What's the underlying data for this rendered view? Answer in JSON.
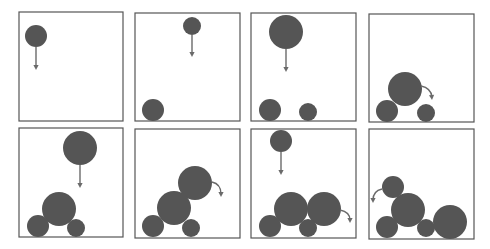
{
  "figure": {
    "colors": {
      "ball": "#555555",
      "frame": "#555555",
      "arrow": "#6a6a6a",
      "background": "#ffffff"
    },
    "panels": [
      {
        "id": 1,
        "frame": [
          19,
          12,
          104,
          109
        ],
        "balls": [
          {
            "cx": 36,
            "cy": 36,
            "r": 11
          }
        ],
        "arrows": [
          {
            "type": "straight",
            "from": [
              36,
              47
            ],
            "to": [
              36,
              70
            ]
          }
        ]
      },
      {
        "id": 2,
        "frame": [
          135,
          13,
          105,
          108
        ],
        "balls": [
          {
            "cx": 192,
            "cy": 26,
            "r": 9
          },
          {
            "cx": 153,
            "cy": 110,
            "r": 11
          }
        ],
        "arrows": [
          {
            "type": "straight",
            "from": [
              192,
              35
            ],
            "to": [
              192,
              57
            ]
          }
        ]
      },
      {
        "id": 3,
        "frame": [
          251,
          13,
          105,
          108
        ],
        "balls": [
          {
            "cx": 286,
            "cy": 32,
            "r": 17
          },
          {
            "cx": 270,
            "cy": 110,
            "r": 11
          },
          {
            "cx": 308,
            "cy": 112,
            "r": 9
          }
        ],
        "arrows": [
          {
            "type": "straight",
            "from": [
              286,
              49
            ],
            "to": [
              286,
              72
            ]
          }
        ]
      },
      {
        "id": 4,
        "frame": [
          369,
          14,
          105,
          108
        ],
        "balls": [
          {
            "cx": 405,
            "cy": 89,
            "r": 17
          },
          {
            "cx": 387,
            "cy": 111,
            "r": 11
          },
          {
            "cx": 426,
            "cy": 113,
            "r": 9
          }
        ],
        "arrows": [
          {
            "type": "curved",
            "from": [
              421,
              86
            ],
            "ctrl": [
              431,
              88
            ],
            "to": [
              432,
              100
            ]
          }
        ]
      },
      {
        "id": 5,
        "frame": [
          19,
          128,
          104,
          109
        ],
        "balls": [
          {
            "cx": 80,
            "cy": 148,
            "r": 17
          },
          {
            "cx": 59,
            "cy": 209,
            "r": 17
          },
          {
            "cx": 38,
            "cy": 226,
            "r": 11
          },
          {
            "cx": 76,
            "cy": 228,
            "r": 9
          }
        ],
        "arrows": [
          {
            "type": "straight",
            "from": [
              80,
              165
            ],
            "to": [
              80,
              188
            ]
          }
        ]
      },
      {
        "id": 6,
        "frame": [
          135,
          129,
          105,
          109
        ],
        "balls": [
          {
            "cx": 195,
            "cy": 183,
            "r": 17
          },
          {
            "cx": 174,
            "cy": 208,
            "r": 17
          },
          {
            "cx": 153,
            "cy": 226,
            "r": 11
          },
          {
            "cx": 191,
            "cy": 228,
            "r": 9
          }
        ],
        "arrows": [
          {
            "type": "curved",
            "from": [
              212,
              182
            ],
            "ctrl": [
              221,
              184
            ],
            "to": [
              221,
              197
            ]
          }
        ]
      },
      {
        "id": 7,
        "frame": [
          251,
          129,
          105,
          109
        ],
        "balls": [
          {
            "cx": 281,
            "cy": 141,
            "r": 11
          },
          {
            "cx": 291,
            "cy": 209,
            "r": 17
          },
          {
            "cx": 324,
            "cy": 209,
            "r": 17
          },
          {
            "cx": 270,
            "cy": 226,
            "r": 11
          },
          {
            "cx": 308,
            "cy": 228,
            "r": 9
          }
        ],
        "arrows": [
          {
            "type": "straight",
            "from": [
              281,
              152
            ],
            "to": [
              281,
              175
            ]
          },
          {
            "type": "curved",
            "from": [
              340,
              210
            ],
            "ctrl": [
              350,
              212
            ],
            "to": [
              350,
              223
            ]
          }
        ]
      },
      {
        "id": 8,
        "frame": [
          369,
          129,
          105,
          110
        ],
        "balls": [
          {
            "cx": 393,
            "cy": 187,
            "r": 11
          },
          {
            "cx": 408,
            "cy": 210,
            "r": 17
          },
          {
            "cx": 387,
            "cy": 227,
            "r": 11
          },
          {
            "cx": 426,
            "cy": 228,
            "r": 9
          },
          {
            "cx": 450,
            "cy": 222,
            "r": 17
          }
        ],
        "arrows": [
          {
            "type": "curved",
            "from": [
              382,
              189
            ],
            "ctrl": [
              373,
              191
            ],
            "to": [
              373,
              203
            ]
          }
        ]
      }
    ]
  }
}
